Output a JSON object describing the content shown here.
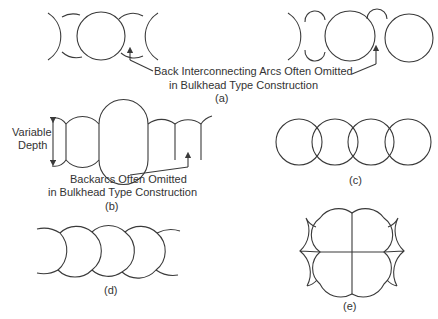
{
  "figure": {
    "panels": [
      {
        "id": "a",
        "label": "(a)",
        "annotation_lines": [
          "Back Interconnecting Arcs Often Omitted",
          "in Bulkhead Type Construction"
        ]
      },
      {
        "id": "b",
        "label": "(b)",
        "dimension_label_lines": [
          "Variable",
          "Depth"
        ],
        "annotation_lines": [
          "Backarcs Often Omitted",
          "in Bulkhead Type Construction"
        ]
      },
      {
        "id": "c",
        "label": "(c)"
      },
      {
        "id": "d",
        "label": "(d)"
      },
      {
        "id": "e",
        "label": "(e)"
      }
    ],
    "line_color": "#3a3a3a",
    "text_color": "#333333"
  }
}
